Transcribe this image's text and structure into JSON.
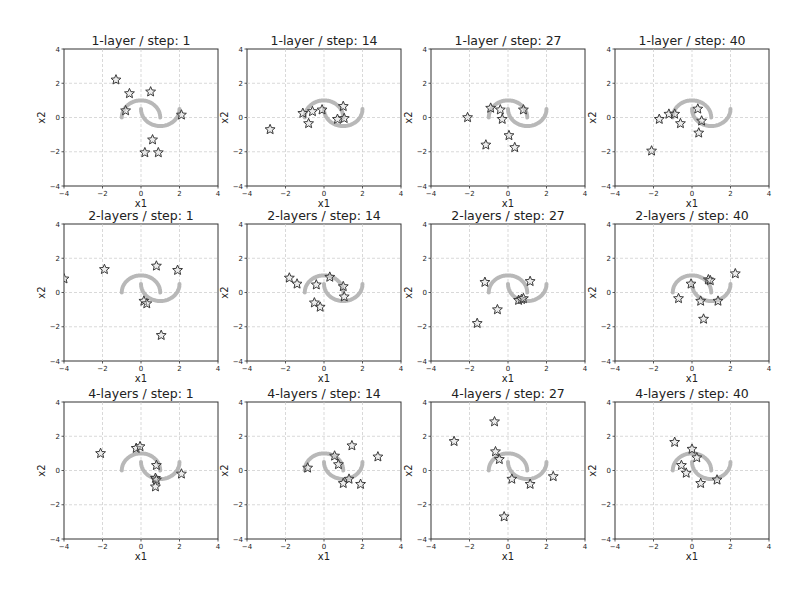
{
  "figure": {
    "rows": [
      "1-layer",
      "2-layers",
      "4-layers"
    ],
    "steps": [
      1,
      14,
      27,
      40
    ]
  },
  "chart_data": [
    {
      "type": "scatter",
      "title": "1-layer / step: 1",
      "xlabel": "x1",
      "ylabel": "x2",
      "xlim": [
        -4,
        4
      ],
      "ylim": [
        -4,
        4
      ],
      "xticks": [
        -4,
        -2,
        0,
        2,
        4
      ],
      "yticks": [
        -4,
        -2,
        0,
        2,
        4
      ],
      "grid": true,
      "series": [
        {
          "name": "samples",
          "marker": "star",
          "points": [
            [
              -1.3,
              2.2
            ],
            [
              -0.6,
              1.4
            ],
            [
              0.5,
              1.5
            ],
            [
              -0.8,
              0.4
            ],
            [
              2.1,
              0.15
            ],
            [
              0.6,
              -1.3
            ],
            [
              0.2,
              -2.05
            ],
            [
              0.9,
              -2.05
            ]
          ]
        },
        {
          "name": "two-moons data",
          "marker": "dot",
          "points": "moons"
        }
      ]
    },
    {
      "type": "scatter",
      "title": "1-layer / step: 14",
      "xlabel": "x1",
      "ylabel": "x2",
      "xlim": [
        -4,
        4
      ],
      "ylim": [
        -4,
        4
      ],
      "xticks": [
        -4,
        -2,
        0,
        2,
        4
      ],
      "yticks": [
        -4,
        -2,
        0,
        2,
        4
      ],
      "grid": true,
      "series": [
        {
          "name": "samples",
          "marker": "star",
          "points": [
            [
              -2.8,
              -0.7
            ],
            [
              -1.1,
              0.25
            ],
            [
              -0.8,
              -0.35
            ],
            [
              -0.6,
              0.35
            ],
            [
              -0.1,
              0.45
            ],
            [
              0.7,
              -0.1
            ],
            [
              1.0,
              0.65
            ],
            [
              1.05,
              -0.05
            ]
          ]
        },
        {
          "name": "two-moons data",
          "marker": "dot",
          "points": "moons"
        }
      ]
    },
    {
      "type": "scatter",
      "title": "1-layer / step: 27",
      "xlabel": "x1",
      "ylabel": "x2",
      "xlim": [
        -4,
        4
      ],
      "ylim": [
        -4,
        4
      ],
      "xticks": [
        -4,
        -2,
        0,
        2,
        4
      ],
      "yticks": [
        -4,
        -2,
        0,
        2,
        4
      ],
      "grid": true,
      "series": [
        {
          "name": "samples",
          "marker": "star",
          "points": [
            [
              -2.1,
              0.0
            ],
            [
              -0.9,
              0.55
            ],
            [
              -0.4,
              0.45
            ],
            [
              -0.3,
              -0.1
            ],
            [
              0.8,
              0.45
            ],
            [
              0.05,
              -1.05
            ],
            [
              -1.15,
              -1.6
            ],
            [
              0.35,
              -1.75
            ]
          ]
        },
        {
          "name": "two-moons data",
          "marker": "dot",
          "points": "moons"
        }
      ]
    },
    {
      "type": "scatter",
      "title": "1-layer / step: 40",
      "xlabel": "x1",
      "ylabel": "x2",
      "xlim": [
        -4,
        4
      ],
      "ylim": [
        -4,
        4
      ],
      "xticks": [
        -4,
        -2,
        0,
        2,
        4
      ],
      "yticks": [
        -4,
        -2,
        0,
        2,
        4
      ],
      "grid": true,
      "series": [
        {
          "name": "samples",
          "marker": "star",
          "points": [
            [
              -2.1,
              -1.95
            ],
            [
              -1.7,
              -0.1
            ],
            [
              -1.2,
              0.2
            ],
            [
              -0.9,
              0.2
            ],
            [
              -0.6,
              -0.35
            ],
            [
              0.3,
              0.5
            ],
            [
              0.5,
              -0.2
            ],
            [
              0.35,
              -0.9
            ]
          ]
        },
        {
          "name": "two-moons data",
          "marker": "dot",
          "points": "moons"
        }
      ]
    },
    {
      "type": "scatter",
      "title": "2-layers / step: 1",
      "xlabel": "x1",
      "ylabel": "x2",
      "xlim": [
        -4,
        4
      ],
      "ylim": [
        -4,
        4
      ],
      "xticks": [
        -4,
        -2,
        0,
        2,
        4
      ],
      "yticks": [
        -4,
        -2,
        0,
        2,
        4
      ],
      "grid": true,
      "series": [
        {
          "name": "samples",
          "marker": "star",
          "points": [
            [
              -4.0,
              0.8
            ],
            [
              -1.9,
              1.35
            ],
            [
              0.8,
              1.55
            ],
            [
              1.9,
              1.3
            ],
            [
              0.15,
              -0.5
            ],
            [
              0.3,
              -0.65
            ],
            [
              1.05,
              -2.5
            ]
          ]
        },
        {
          "name": "two-moons data",
          "marker": "dot",
          "points": "moons"
        }
      ]
    },
    {
      "type": "scatter",
      "title": "2-layers / step: 14",
      "xlabel": "x1",
      "ylabel": "x2",
      "xlim": [
        -4,
        4
      ],
      "ylim": [
        -4,
        4
      ],
      "xticks": [
        -4,
        -2,
        0,
        2,
        4
      ],
      "yticks": [
        -4,
        -2,
        0,
        2,
        4
      ],
      "grid": true,
      "series": [
        {
          "name": "samples",
          "marker": "star",
          "points": [
            [
              -1.8,
              0.85
            ],
            [
              -1.4,
              0.5
            ],
            [
              -0.4,
              0.45
            ],
            [
              0.3,
              0.9
            ],
            [
              1.0,
              0.35
            ],
            [
              1.05,
              -0.25
            ],
            [
              -0.5,
              -0.6
            ],
            [
              -0.2,
              -0.85
            ]
          ]
        },
        {
          "name": "two-moons data",
          "marker": "dot",
          "points": "moons"
        }
      ]
    },
    {
      "type": "scatter",
      "title": "2-layers / step: 27",
      "xlabel": "x1",
      "ylabel": "x2",
      "xlim": [
        -4,
        4
      ],
      "ylim": [
        -4,
        4
      ],
      "xticks": [
        -4,
        -2,
        0,
        2,
        4
      ],
      "yticks": [
        -4,
        -2,
        0,
        2,
        4
      ],
      "grid": true,
      "series": [
        {
          "name": "samples",
          "marker": "star",
          "points": [
            [
              -1.2,
              0.6
            ],
            [
              1.15,
              0.65
            ],
            [
              -0.55,
              -1.0
            ],
            [
              -1.6,
              -1.8
            ],
            [
              0.55,
              -0.45
            ],
            [
              0.7,
              -0.4
            ],
            [
              0.8,
              -0.35
            ]
          ]
        },
        {
          "name": "two-moons data",
          "marker": "dot",
          "points": "moons"
        }
      ]
    },
    {
      "type": "scatter",
      "title": "2-layers / step: 40",
      "xlabel": "x1",
      "ylabel": "x2",
      "xlim": [
        -4,
        4
      ],
      "ylim": [
        -4,
        4
      ],
      "xticks": [
        -4,
        -2,
        0,
        2,
        4
      ],
      "yticks": [
        -4,
        -2,
        0,
        2,
        4
      ],
      "grid": true,
      "series": [
        {
          "name": "samples",
          "marker": "star",
          "points": [
            [
              -0.7,
              -0.35
            ],
            [
              -0.05,
              0.5
            ],
            [
              0.85,
              0.75
            ],
            [
              0.95,
              0.7
            ],
            [
              2.25,
              1.1
            ],
            [
              0.45,
              -0.5
            ],
            [
              1.35,
              -0.5
            ],
            [
              0.6,
              -1.55
            ]
          ]
        },
        {
          "name": "two-moons data",
          "marker": "dot",
          "points": "moons"
        }
      ]
    },
    {
      "type": "scatter",
      "title": "4-layers / step: 1",
      "xlabel": "x1",
      "ylabel": "x2",
      "xlim": [
        -4,
        4
      ],
      "ylim": [
        -4,
        4
      ],
      "xticks": [
        -4,
        -2,
        0,
        2,
        4
      ],
      "yticks": [
        -4,
        -2,
        0,
        2,
        4
      ],
      "grid": true,
      "series": [
        {
          "name": "samples",
          "marker": "star",
          "points": [
            [
              -2.1,
              1.0
            ],
            [
              -0.25,
              1.3
            ],
            [
              -0.05,
              1.4
            ],
            [
              0.8,
              0.3
            ],
            [
              0.75,
              -0.45
            ],
            [
              0.8,
              -0.55
            ],
            [
              0.75,
              -0.95
            ],
            [
              2.1,
              -0.2
            ]
          ]
        },
        {
          "name": "two-moons data",
          "marker": "dot",
          "points": "moons"
        }
      ]
    },
    {
      "type": "scatter",
      "title": "4-layers / step: 14",
      "xlabel": "x1",
      "ylabel": "x2",
      "xlim": [
        -4,
        4
      ],
      "ylim": [
        -4,
        4
      ],
      "xticks": [
        -4,
        -2,
        0,
        2,
        4
      ],
      "yticks": [
        -4,
        -2,
        0,
        2,
        4
      ],
      "grid": true,
      "series": [
        {
          "name": "samples",
          "marker": "star",
          "points": [
            [
              -0.85,
              0.15
            ],
            [
              0.55,
              0.85
            ],
            [
              0.75,
              0.35
            ],
            [
              1.45,
              1.45
            ],
            [
              2.8,
              0.8
            ],
            [
              1.0,
              -0.75
            ],
            [
              1.3,
              -0.5
            ],
            [
              1.9,
              -0.8
            ]
          ]
        },
        {
          "name": "two-moons data",
          "marker": "dot",
          "points": "moons"
        }
      ]
    },
    {
      "type": "scatter",
      "title": "4-layers / step: 27",
      "xlabel": "x1",
      "ylabel": "x2",
      "xlim": [
        -4,
        4
      ],
      "ylim": [
        -4,
        4
      ],
      "xticks": [
        -4,
        -2,
        0,
        2,
        4
      ],
      "yticks": [
        -4,
        -2,
        0,
        2,
        4
      ],
      "grid": true,
      "series": [
        {
          "name": "samples",
          "marker": "star",
          "points": [
            [
              -2.8,
              1.7
            ],
            [
              -0.7,
              2.85
            ],
            [
              -0.65,
              1.1
            ],
            [
              -0.45,
              0.65
            ],
            [
              0.2,
              -0.5
            ],
            [
              1.15,
              -0.8
            ],
            [
              2.35,
              -0.35
            ],
            [
              -0.2,
              -2.7
            ]
          ]
        },
        {
          "name": "two-moons data",
          "marker": "dot",
          "points": "moons"
        }
      ]
    },
    {
      "type": "scatter",
      "title": "4-layers / step: 40",
      "xlabel": "x1",
      "ylabel": "x2",
      "xlim": [
        -4,
        4
      ],
      "ylim": [
        -4,
        4
      ],
      "xticks": [
        -4,
        -2,
        0,
        2,
        4
      ],
      "yticks": [
        -4,
        -2,
        0,
        2,
        4
      ],
      "grid": true,
      "series": [
        {
          "name": "samples",
          "marker": "star",
          "points": [
            [
              -0.9,
              1.65
            ],
            [
              0.0,
              1.25
            ],
            [
              0.25,
              0.75
            ],
            [
              -0.55,
              0.3
            ],
            [
              -0.3,
              -0.15
            ],
            [
              0.45,
              -0.75
            ],
            [
              1.3,
              -0.55
            ]
          ]
        },
        {
          "name": "two-moons data",
          "marker": "dot",
          "points": "moons"
        }
      ]
    }
  ],
  "colors": {
    "star_edge": "#3a3a3a",
    "moon": "#b0b0b0",
    "grid": "#c8c8c8",
    "frame": "#333333"
  }
}
